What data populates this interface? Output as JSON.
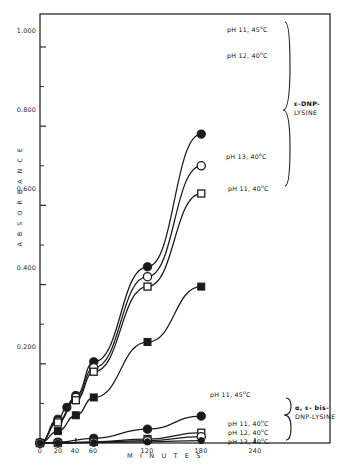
{
  "chart_data": {
    "type": "line",
    "title": "",
    "xlabel": "M I N U T E S",
    "ylabel": "A B S O R B A N C E",
    "xlim": [
      0,
      250
    ],
    "ylim": [
      0,
      1.11
    ],
    "grid": false,
    "legend_position": "inline-right",
    "x_ticks": [
      0,
      20,
      40,
      60,
      120,
      180,
      240
    ],
    "x_tick_labels": [
      "0",
      "20",
      "40",
      "60",
      "120",
      "180",
      "240"
    ],
    "y_ticks": [
      0.2,
      0.4,
      0.6,
      0.8,
      1.0
    ],
    "y_tick_labels": [
      "0.200",
      "0.400",
      "0.600",
      "0.800",
      "1.000"
    ],
    "y_minor_ticks": [
      0.1,
      0.3,
      0.5,
      0.7,
      0.9
    ],
    "groups": [
      {
        "name": "ε-DNP-LYSINE",
        "label_lines": [
          "ε-DNP-",
          "LYSINE"
        ],
        "bracket": "right"
      },
      {
        "name": "α, ε- bis-DNP-LYSINE",
        "label_lines": [
          "α, ε- bis-",
          "DNP-LYSINE"
        ],
        "bracket": "right"
      }
    ],
    "series": [
      {
        "name": "pH 11, 45C (e-DNP-lysine)",
        "label": "pH 11, 45",
        "label_sup": "o",
        "label_tail": "C",
        "group": "ε-DNP-LYSINE",
        "marker": "filled-circle",
        "x": [
          0,
          20,
          30,
          40,
          60,
          120,
          180
        ],
        "y": [
          0.0,
          0.06,
          0.09,
          0.12,
          0.205,
          0.445,
          0.78
        ]
      },
      {
        "name": "pH 12, 40C (e-DNP-lysine)",
        "label": "pH 12, 40",
        "label_sup": "o",
        "label_tail": "C",
        "group": "ε-DNP-LYSINE",
        "marker": "open-circle",
        "x": [
          0,
          20,
          40,
          60,
          120,
          180
        ],
        "y": [
          0.0,
          0.055,
          0.115,
          0.19,
          0.42,
          0.7
        ]
      },
      {
        "name": "pH 13, 40C (e-DNP-lysine)",
        "label": "pH 13, 40",
        "label_sup": "o",
        "label_tail": "C",
        "group": "ε-DNP-LYSINE",
        "marker": "open-square",
        "x": [
          0,
          20,
          40,
          60,
          120,
          180
        ],
        "y": [
          0.0,
          0.052,
          0.108,
          0.18,
          0.395,
          0.63
        ]
      },
      {
        "name": "pH 11, 40C (e-DNP-lysine)",
        "label": "pH 11, 40",
        "label_sup": "o",
        "label_tail": "C",
        "group": "ε-DNP-LYSINE",
        "marker": "filled-square",
        "x": [
          0,
          20,
          40,
          60,
          120,
          180
        ],
        "y": [
          0.0,
          0.03,
          0.07,
          0.115,
          0.255,
          0.395
        ]
      },
      {
        "name": "pH 11, 45C (bis-DNP-lysine)",
        "label": "pH 11, 45",
        "label_sup": "o",
        "label_tail": "C",
        "group": "α, ε- bis-DNP-LYSINE",
        "marker": "filled-circle",
        "x": [
          0,
          20,
          60,
          120,
          180
        ],
        "y": [
          0.0,
          0.002,
          0.012,
          0.035,
          0.068
        ]
      },
      {
        "name": "pH 11, 40C (bis-DNP-lysine)",
        "label": "pH 11, 40",
        "label_sup": "o",
        "label_tail": "C",
        "group": "α, ε- bis-DNP-LYSINE",
        "marker": "open-square",
        "x": [
          0,
          20,
          60,
          120,
          180
        ],
        "y": [
          0.0,
          0.0,
          0.003,
          0.01,
          0.026
        ]
      },
      {
        "name": "pH 12, 40C (bis-DNP-lysine)",
        "label": "pH 12, 40",
        "label_sup": "o",
        "label_tail": "C",
        "group": "α, ε- bis-DNP-LYSINE",
        "marker": "open-circle",
        "x": [
          0,
          20,
          60,
          120,
          180
        ],
        "y": [
          0.0,
          0.0,
          0.002,
          0.006,
          0.016
        ]
      },
      {
        "name": "pH 13, 40C (bis-DNP-lysine)",
        "label": "pH 13, 40",
        "label_sup": "o",
        "label_tail": "C",
        "group": "α, ε- bis-DNP-LYSINE",
        "marker": "filled-circle-small",
        "x": [
          0,
          20,
          60,
          120,
          180
        ],
        "y": [
          0.0,
          0.0,
          0.001,
          0.003,
          0.006
        ]
      }
    ],
    "colors": {
      "line": "#1a1a1a",
      "axis": "#2b2b2b",
      "frame": "#2b2b2b",
      "background": "#ffffff",
      "text": "#111111"
    }
  },
  "annotations": {
    "series_labels": [
      {
        "id": "s0",
        "text": "pH 11, 45",
        "sup": "o",
        "tail": "C"
      },
      {
        "id": "s1",
        "text": "pH 12, 40",
        "sup": "o",
        "tail": "C"
      },
      {
        "id": "s2",
        "text": "pH 13, 40",
        "sup": "o",
        "tail": "C"
      },
      {
        "id": "s3",
        "text": "pH 11, 40",
        "sup": "o",
        "tail": "C"
      },
      {
        "id": "s4",
        "text": "pH 11, 45",
        "sup": "o",
        "tail": "C"
      },
      {
        "id": "s5",
        "text": "pH 11, 40",
        "sup": "o",
        "tail": "C"
      },
      {
        "id": "s6",
        "text": "pH 12, 40",
        "sup": "o",
        "tail": "C"
      },
      {
        "id": "s7",
        "text": "pH 13, 40",
        "sup": "o",
        "tail": "C"
      }
    ],
    "group_top_line1": "ε-DNP-",
    "group_top_line2": "LYSINE",
    "group_bottom_line1": "α, ε- bis-",
    "group_bottom_line2": "DNP-LYSINE"
  }
}
